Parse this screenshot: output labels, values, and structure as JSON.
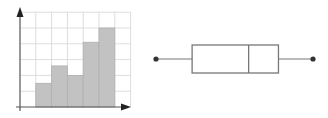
{
  "chart_data": [
    {
      "type": "bar",
      "subtype": "histogram",
      "title": "",
      "xlabel": "",
      "ylabel": "",
      "categories": [
        "bin1",
        "bin2",
        "bin3",
        "bin4",
        "bin5"
      ],
      "values": [
        1.5,
        2.6,
        2.0,
        4.1,
        5.0
      ],
      "ylim": [
        0,
        6
      ],
      "grid": true,
      "bar_color": "#c2c2c2",
      "axis_arrows": true,
      "tick_labels": false
    },
    {
      "type": "box",
      "orientation": "horizontal",
      "title": "",
      "min": 0,
      "q1": 0.23,
      "median": 0.59,
      "q3": 0.78,
      "max": 1,
      "note": "No scale shown; values are relative positions (0–1) between whisker endpoints",
      "line_color": "#777777",
      "whisker_end_marker": "dot"
    }
  ],
  "colors": {
    "grid": "#dddddd",
    "axis": "#555555",
    "bar_fill": "#c2c2c2",
    "bar_edge": "#b0b0b0",
    "box_line": "#7a7a7a",
    "dot": "#333333"
  }
}
